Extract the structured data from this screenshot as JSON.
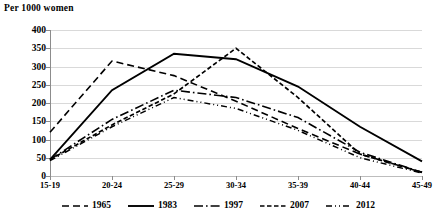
{
  "chart_data": {
    "type": "line",
    "title": "",
    "ylabel": "Per 1000 women",
    "xlabel": "",
    "categories": [
      "15-19",
      "20-24",
      "25-29",
      "30-34",
      "35-39",
      "40-44",
      "45-49"
    ],
    "ylim": [
      0,
      400
    ],
    "yticks": [
      0,
      50,
      100,
      150,
      200,
      250,
      300,
      350,
      400
    ],
    "grid": true,
    "legend_position": "bottom",
    "series": [
      {
        "name": "1965",
        "style": "dashed",
        "values": [
          120,
          315,
          275,
          205,
          130,
          60,
          10
        ]
      },
      {
        "name": "1983",
        "style": "solid",
        "values": [
          45,
          235,
          335,
          320,
          245,
          135,
          40
        ]
      },
      {
        "name": "1997",
        "style": "dash-dot",
        "values": [
          45,
          155,
          235,
          215,
          160,
          65,
          10
        ]
      },
      {
        "name": "2007",
        "style": "short-dash",
        "values": [
          45,
          140,
          225,
          350,
          215,
          60,
          10
        ]
      },
      {
        "name": "2012",
        "style": "dotted-dash",
        "values": [
          42,
          135,
          215,
          185,
          125,
          50,
          8
        ]
      }
    ]
  },
  "legend": {
    "items": [
      {
        "label": "1965"
      },
      {
        "label": "1983"
      },
      {
        "label": "1997"
      },
      {
        "label": "2007"
      },
      {
        "label": "2012"
      }
    ]
  },
  "colors": {
    "series_stroke": "#000000",
    "gridline": "#d9d9d9",
    "axis": "#8c8c8c",
    "background": "#ffffff"
  }
}
